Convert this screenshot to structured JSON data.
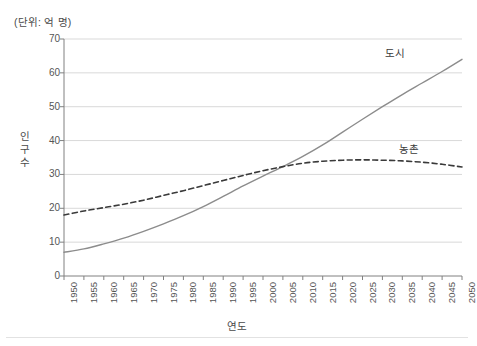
{
  "unit_note": "(단위: 억 명)",
  "axes": {
    "y_title": "인 구 수",
    "y_title_chars": [
      "인",
      "구",
      "수"
    ],
    "x_title": "연도"
  },
  "series_labels": {
    "urban": "도시",
    "rural": "농촌"
  },
  "colors": {
    "urban_line": "#8c8c8c",
    "rural_line": "#3a3a3a",
    "gridline": "#d9d9d9",
    "axis": "#808080",
    "text": "#4a4a4a",
    "background": "#ffffff"
  },
  "chart_data": {
    "type": "line",
    "title": "",
    "subtitle": "",
    "annotation_unit": "(단위: 억 명)",
    "xlabel": "연도",
    "ylabel": "인구 수",
    "xlim": [
      1950,
      2050
    ],
    "ylim": [
      0,
      70
    ],
    "y_ticks": [
      0,
      10,
      20,
      30,
      40,
      50,
      60,
      70
    ],
    "y_ticklabels": [
      "0",
      "10",
      "20",
      "30",
      "40",
      "50",
      "60",
      "70"
    ],
    "grid": "horizontal",
    "legend": "inline-labels",
    "x": [
      1950,
      1955,
      1960,
      1965,
      1970,
      1975,
      1980,
      1985,
      1990,
      1995,
      2000,
      2005,
      2010,
      2015,
      2020,
      2025,
      2030,
      2035,
      2040,
      2045,
      2050
    ],
    "x_ticklabels": [
      "1950",
      "1955",
      "1960",
      "1965",
      "1970",
      "1975",
      "1980",
      "1985",
      "1990",
      "1995",
      "2000",
      "2005",
      "2010",
      "2015",
      "2020",
      "2025",
      "2030",
      "2035",
      "2040",
      "2045",
      "2050"
    ],
    "series": [
      {
        "name": "도시",
        "style": "solid",
        "color": "#8c8c8c",
        "values": [
          7.0,
          8.0,
          9.5,
          11.2,
          13.2,
          15.4,
          17.8,
          20.5,
          23.5,
          26.6,
          29.5,
          32.3,
          35.3,
          38.7,
          42.5,
          46.3,
          50.0,
          53.6,
          57.0,
          60.4,
          64.0
        ]
      },
      {
        "name": "농촌",
        "style": "dashed",
        "color": "#3a3a3a",
        "values": [
          18.0,
          19.2,
          20.2,
          21.2,
          22.4,
          23.8,
          25.2,
          26.7,
          28.2,
          29.7,
          31.1,
          32.3,
          33.3,
          33.9,
          34.2,
          34.3,
          34.2,
          34.0,
          33.6,
          33.0,
          32.2
        ]
      }
    ],
    "notes": {
      "crossover_year": 2007,
      "crossover_value": 33
    }
  }
}
